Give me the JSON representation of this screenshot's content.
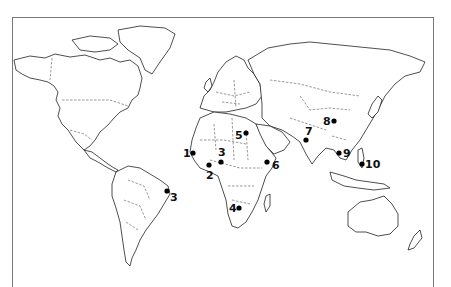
{
  "map": {
    "type": "world-outline",
    "projection": "equirectangular-like",
    "colors": {
      "land_fill": "#ffffff",
      "coast": "#222222",
      "dot": "#000000",
      "frame": "#777777"
    },
    "points": [
      {
        "label": "1",
        "region": "West Africa (Senegal/Guinea)",
        "dot": [
          193,
          153
        ],
        "label_pos": [
          183,
          148
        ]
      },
      {
        "label": "2",
        "region": "West Africa (Ghana/Togo)",
        "dot": [
          209,
          165
        ],
        "label_pos": [
          206,
          170
        ]
      },
      {
        "label": "3",
        "region": "West Africa (Nigeria/Niger)",
        "dot": [
          221,
          162
        ],
        "label_pos": [
          218,
          147
        ]
      },
      {
        "label": "3",
        "region": "Eastern Brazil",
        "dot": [
          167,
          191
        ],
        "label_pos": [
          170,
          192
        ]
      },
      {
        "label": "4",
        "region": "Southern Africa (Botswana)",
        "dot": [
          239,
          208
        ],
        "label_pos": [
          229,
          203
        ]
      },
      {
        "label": "5",
        "region": "Egypt",
        "dot": [
          246,
          133
        ],
        "label_pos": [
          235,
          130
        ]
      },
      {
        "label": "6",
        "region": "Horn of Africa (Ethiopia/Somalia)",
        "dot": [
          267,
          162
        ],
        "label_pos": [
          272,
          160
        ]
      },
      {
        "label": "7",
        "region": "India",
        "dot": [
          306,
          140
        ],
        "label_pos": [
          305,
          126
        ]
      },
      {
        "label": "8",
        "region": "China",
        "dot": [
          334,
          121
        ],
        "label_pos": [
          323,
          116
        ]
      },
      {
        "label": "9",
        "region": "Indochina (Thailand/Cambodia)",
        "dot": [
          339,
          153
        ],
        "label_pos": [
          343,
          148
        ]
      },
      {
        "label": "10",
        "region": "Philippines",
        "dot": [
          362,
          164
        ],
        "label_pos": [
          365,
          159
        ]
      }
    ]
  }
}
